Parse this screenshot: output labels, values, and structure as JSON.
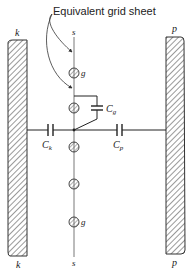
{
  "diagram": {
    "title": "Equivalent grid sheet",
    "electrodes": {
      "cathode": {
        "label_top": "k",
        "label_bottom": "k"
      },
      "plate": {
        "label_top": "p",
        "label_bottom": "p"
      }
    },
    "grid": {
      "sheet_label_top": "s",
      "sheet_label_bottom": "s",
      "wire_label_1": "g",
      "wire_label_2": "g"
    },
    "capacitors": {
      "cathode": {
        "label": "C",
        "sub": "k"
      },
      "plate": {
        "label": "C",
        "sub": "p"
      },
      "grid": {
        "label": "C",
        "sub": "g"
      }
    },
    "colors": {
      "ink": "#222222",
      "hatch": "#555555",
      "wire_fill": "#dddddd"
    }
  }
}
